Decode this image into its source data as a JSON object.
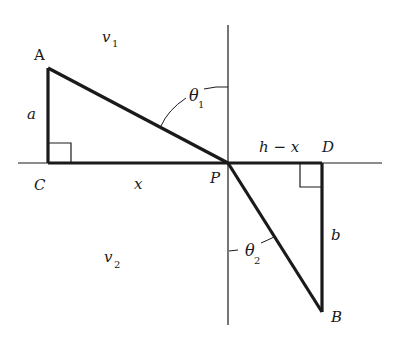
{
  "diagram": {
    "colors": {
      "line": "#1a1a1a",
      "background": "#ffffff"
    },
    "points": {
      "A": {
        "label": "A",
        "x": 48,
        "y": 68
      },
      "C": {
        "label": "C",
        "x": 48,
        "y": 163
      },
      "P": {
        "label": "P",
        "x": 228,
        "y": 163
      },
      "D": {
        "label": "D",
        "x": 322,
        "y": 163
      },
      "B": {
        "label": "B",
        "x": 322,
        "y": 312
      }
    },
    "labels": {
      "v1": {
        "main": "v",
        "sub": "1"
      },
      "v2": {
        "main": "v",
        "sub": "2"
      },
      "theta1": {
        "main": "θ",
        "sub": "1"
      },
      "theta2": {
        "main": "θ",
        "sub": "2"
      },
      "a": "a",
      "b": "b",
      "x": "x",
      "h_minus_x": "h − x"
    }
  }
}
